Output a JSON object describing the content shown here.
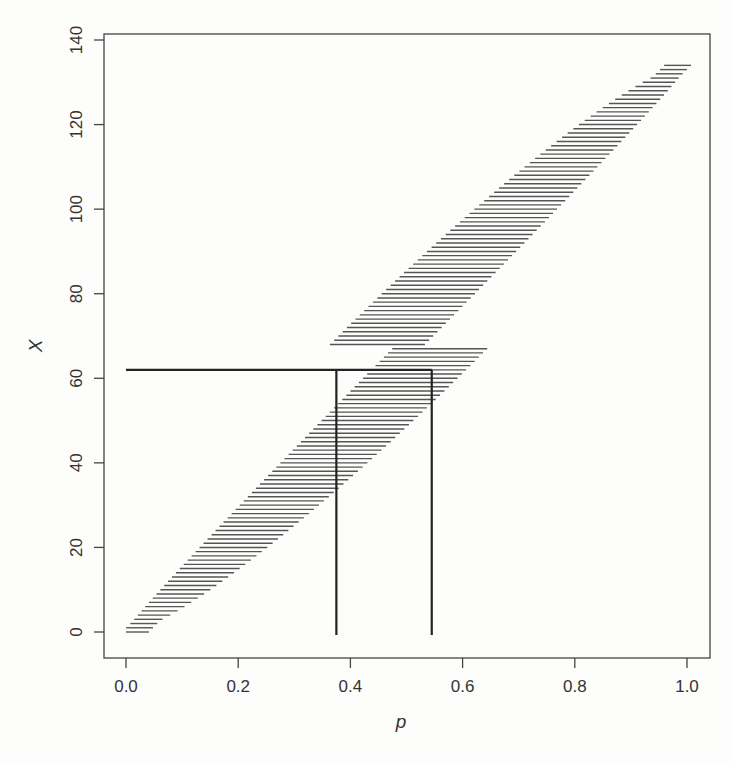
{
  "chart_data": {
    "type": "line",
    "title": "",
    "xlabel": "p",
    "ylabel": "X",
    "xlim": [
      0.0,
      1.0
    ],
    "ylim": [
      0,
      140
    ],
    "x_ticks": [
      "0.0",
      "0.2",
      "0.4",
      "0.6",
      "0.8",
      "1.0"
    ],
    "y_ticks": [
      "0",
      "20",
      "40",
      "60",
      "80",
      "100",
      "120",
      "140"
    ],
    "grid": false,
    "legend": null,
    "n": 134,
    "belt_description": "Horizontal segments for each X = 0..134 spanning the acceptance range of p (binomial confidence belt)",
    "annotation": {
      "observed_x": 62,
      "horizontal_line": {
        "x_from": 0.0,
        "x_to": 0.545,
        "y": 62
      },
      "vertical_lines": [
        {
          "p": 0.375,
          "y_from": 0,
          "y_to": 62
        },
        {
          "p": 0.545,
          "y_from": 0,
          "y_to": 62
        }
      ],
      "interval": [
        0.375,
        0.545
      ]
    }
  },
  "axes": {
    "x_title": "p",
    "y_title": "X",
    "x_tick_labels": [
      "0.0",
      "0.2",
      "0.4",
      "0.6",
      "0.8",
      "1.0"
    ],
    "y_tick_labels": [
      "0",
      "20",
      "40",
      "60",
      "80",
      "100",
      "120",
      "140"
    ]
  }
}
